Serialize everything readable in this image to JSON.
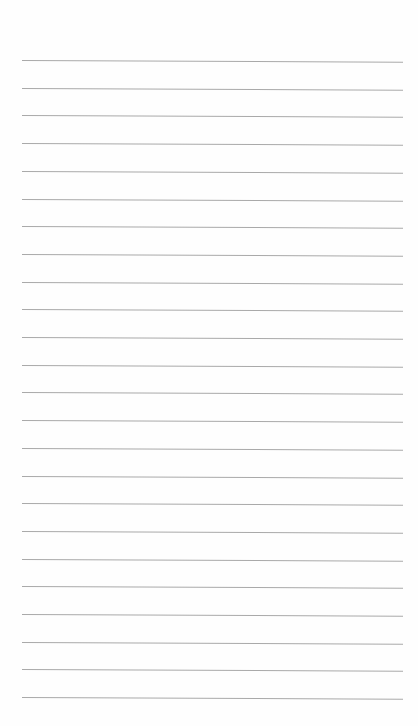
{
  "paper": {
    "type": "lined-paper",
    "background": "#fefefe",
    "line_color": "#a9a9a9",
    "line_count": 24,
    "first_line_y": 60,
    "line_spacing": 27.7,
    "line_left": 22,
    "line_right": 403
  }
}
